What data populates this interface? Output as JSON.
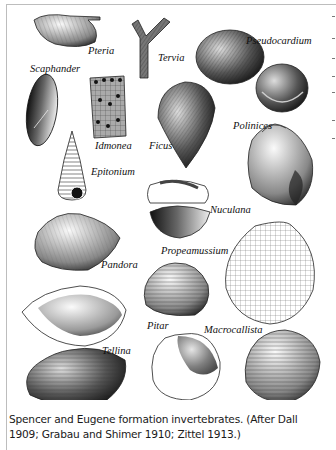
{
  "plate": {
    "labels": {
      "pteria": "Pteria",
      "tervia": "Tervia",
      "pseudocardium": "Pseudocardium",
      "scaphander": "Scaphander",
      "idmonea": "Idmonea",
      "ficus": "Ficus",
      "polinices": "Polinices",
      "epitonium": "Epitonium",
      "nuculana": "Nuculana",
      "pandora": "Pandora",
      "propeamussium": "Propeamussium",
      "pitar": "Pitar",
      "macrocallista": "Macrocallista",
      "tellina": "Tellina"
    }
  },
  "caption": {
    "line1": "Spencer and Eugene formation invertebrates. (After Dall",
    "line2": "1909; Grabau and Shimer 1910; Zittel 1913.)"
  }
}
